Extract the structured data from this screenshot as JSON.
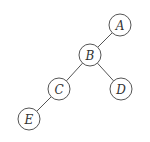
{
  "diagram": {
    "type": "binary-tree",
    "node_radius": 11,
    "colors": {
      "stroke": "#555555",
      "label": "#333333",
      "background": "#ffffff"
    },
    "nodes": [
      {
        "id": "A",
        "label": "A",
        "x": 120,
        "y": 25
      },
      {
        "id": "B",
        "label": "B",
        "x": 90,
        "y": 55
      },
      {
        "id": "C",
        "label": "C",
        "x": 59,
        "y": 89
      },
      {
        "id": "D",
        "label": "D",
        "x": 121,
        "y": 89
      },
      {
        "id": "E",
        "label": "E",
        "x": 29,
        "y": 119
      }
    ],
    "edges": [
      {
        "from": "A",
        "to": "B"
      },
      {
        "from": "B",
        "to": "C"
      },
      {
        "from": "B",
        "to": "D"
      },
      {
        "from": "C",
        "to": "E"
      }
    ]
  }
}
